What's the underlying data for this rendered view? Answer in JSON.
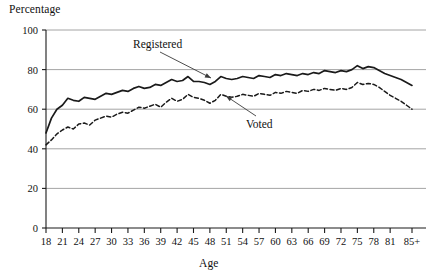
{
  "chart_data": {
    "type": "line",
    "title": "",
    "ylabel": "Percentage",
    "xlabel": "Age",
    "ylim": [
      0,
      100
    ],
    "yticks": [
      0,
      20,
      40,
      60,
      80,
      100
    ],
    "grid": "horizontal",
    "legend_position": "inline-annotations",
    "xticklabels": [
      "18",
      "21",
      "24",
      "27",
      "30",
      "33",
      "36",
      "39",
      "42",
      "45",
      "48",
      "51",
      "54",
      "57",
      "60",
      "63",
      "66",
      "69",
      "72",
      "75",
      "78",
      "81",
      "85+"
    ],
    "x": [
      18,
      19,
      20,
      21,
      22,
      23,
      24,
      25,
      26,
      27,
      28,
      29,
      30,
      31,
      32,
      33,
      34,
      35,
      36,
      37,
      38,
      39,
      40,
      41,
      42,
      43,
      44,
      45,
      46,
      47,
      48,
      49,
      50,
      51,
      52,
      53,
      54,
      55,
      56,
      57,
      58,
      59,
      60,
      61,
      62,
      63,
      64,
      65,
      66,
      67,
      68,
      69,
      70,
      71,
      72,
      73,
      74,
      75,
      76,
      77,
      78,
      79,
      80,
      81,
      82,
      83,
      84,
      85
    ],
    "series": [
      {
        "name": "Registered",
        "style": "solid",
        "color": "#1a1a1a",
        "values": [
          48.0,
          55.5,
          60.0,
          62.0,
          65.5,
          64.5,
          64.0,
          66.0,
          65.5,
          65.0,
          66.5,
          68.0,
          67.5,
          68.5,
          69.5,
          69.0,
          70.5,
          71.5,
          70.5,
          71.0,
          72.5,
          72.0,
          73.5,
          75.0,
          74.0,
          74.5,
          76.5,
          74.0,
          74.0,
          73.5,
          72.5,
          74.0,
          76.5,
          75.5,
          75.0,
          75.5,
          76.5,
          76.0,
          75.5,
          77.0,
          76.5,
          76.0,
          77.5,
          77.0,
          78.0,
          77.5,
          77.0,
          78.0,
          77.5,
          78.5,
          78.0,
          79.5,
          79.0,
          78.5,
          79.5,
          79.0,
          80.0,
          82.0,
          80.5,
          81.5,
          81.0,
          79.5,
          78.0,
          77.0,
          76.0,
          75.0,
          73.5,
          72.0
        ]
      },
      {
        "name": "Voted",
        "style": "dashed",
        "color": "#1a1a1a",
        "values": [
          42.0,
          44.5,
          47.5,
          49.5,
          51.0,
          50.0,
          52.5,
          53.0,
          52.0,
          54.5,
          55.5,
          56.5,
          56.0,
          57.5,
          58.5,
          58.0,
          59.5,
          61.0,
          60.5,
          61.5,
          62.5,
          61.0,
          63.5,
          65.5,
          64.0,
          65.0,
          67.5,
          66.0,
          65.5,
          64.5,
          63.0,
          64.5,
          67.5,
          66.5,
          66.0,
          66.5,
          67.5,
          67.0,
          66.5,
          68.0,
          67.5,
          67.0,
          68.5,
          68.0,
          69.0,
          68.5,
          68.0,
          69.5,
          69.0,
          70.0,
          69.5,
          70.5,
          70.0,
          69.5,
          70.5,
          70.0,
          71.0,
          73.5,
          72.5,
          73.0,
          72.5,
          71.0,
          69.0,
          67.0,
          65.5,
          64.0,
          62.0,
          60.0
        ]
      }
    ],
    "annotations": [
      {
        "text": "Registered",
        "points_to_series": "Registered"
      },
      {
        "text": "Voted",
        "points_to_series": "Voted"
      }
    ]
  }
}
